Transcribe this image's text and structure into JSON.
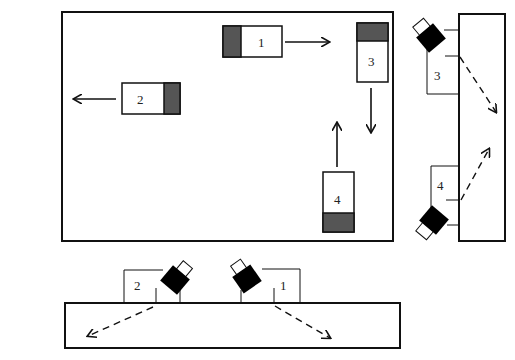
{
  "diagram": {
    "type": "vehicle-headlight-layout",
    "colors": {
      "stroke": "#111111",
      "shade": "#555555",
      "lamp_body": "#000000",
      "background": "#ffffff"
    },
    "top_view": {
      "vehicles": [
        {
          "id": "1",
          "label": "1",
          "direction": "right",
          "shaded_side": "left"
        },
        {
          "id": "2",
          "label": "2",
          "direction": "left",
          "shaded_side": "right"
        },
        {
          "id": "3",
          "label": "3",
          "direction": "down",
          "shaded_side": "top"
        },
        {
          "id": "4",
          "label": "4",
          "direction": "up",
          "shaded_side": "bottom"
        }
      ]
    },
    "side_panel_right": {
      "mounts": [
        {
          "id": "3",
          "label": "3",
          "beam": "down-right (dashed)"
        },
        {
          "id": "4",
          "label": "4",
          "beam": "up-right (dashed)"
        }
      ]
    },
    "side_panel_bottom": {
      "mounts": [
        {
          "id": "2",
          "label": "2",
          "beam": "down-left (dashed)"
        },
        {
          "id": "1",
          "label": "1",
          "beam": "down-right (dashed)"
        }
      ]
    }
  }
}
